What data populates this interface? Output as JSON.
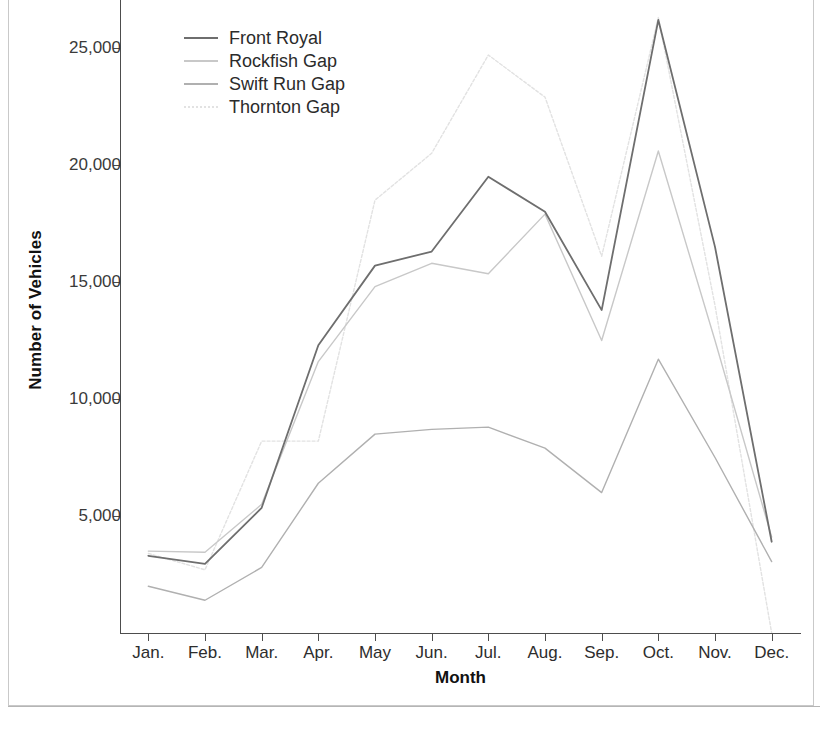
{
  "figure": {
    "y_axis_title": "Number of Vehicles",
    "x_axis_title": "Month",
    "bottom_text": ""
  },
  "legend": {
    "position": "top-left-inside",
    "items": [
      {
        "label": "Front Royal",
        "color": "#6e6e6e"
      },
      {
        "label": "Rockfish Gap",
        "color": "#c8c8c8"
      },
      {
        "label": "Swift Run Gap",
        "color": "#b0b0b0"
      },
      {
        "label": "Thornton Gap",
        "color": "#e2e2e2"
      }
    ]
  },
  "axes": {
    "y_ticks": [
      {
        "value": 5000,
        "label": "5,000"
      },
      {
        "value": 10000,
        "label": "10,000"
      },
      {
        "value": 15000,
        "label": "15,000"
      },
      {
        "value": 20000,
        "label": "20,000"
      },
      {
        "value": 25000,
        "label": "25,000"
      }
    ],
    "x_ticks": [
      "Jan.",
      "Feb.",
      "Mar.",
      "Apr.",
      "May",
      "Jun.",
      "Jul.",
      "Aug.",
      "Sep.",
      "Oct.",
      "Nov.",
      "Dec."
    ]
  },
  "chart_data": {
    "type": "line",
    "title": "",
    "xlabel": "Month",
    "ylabel": "Number of Vehicles",
    "ylim": [
      0,
      27000
    ],
    "grid": false,
    "legend_position": "upper left",
    "categories": [
      "Jan.",
      "Feb.",
      "Mar.",
      "Apr.",
      "May",
      "Jun.",
      "Jul.",
      "Aug.",
      "Sep.",
      "Oct.",
      "Nov.",
      "Dec."
    ],
    "series": [
      {
        "name": "Front Royal",
        "color": "#6e6e6e",
        "style": "solid",
        "values": [
          3300,
          2950,
          5350,
          12300,
          15700,
          16300,
          19500,
          18000,
          13800,
          26200,
          16500,
          3900
        ]
      },
      {
        "name": "Rockfish Gap",
        "color": "#c8c8c8",
        "style": "solid",
        "values": [
          3500,
          3450,
          5500,
          11600,
          14800,
          15800,
          15350,
          17900,
          12500,
          20600,
          12500,
          4100
        ]
      },
      {
        "name": "Swift Run Gap",
        "color": "#b0b0b0",
        "style": "solid",
        "values": [
          2000,
          1400,
          2800,
          6400,
          8500,
          8700,
          8800,
          7900,
          6000,
          11700,
          7500,
          3050
        ]
      },
      {
        "name": "Thornton Gap",
        "color": "#e2e2e2",
        "style": "dotted",
        "values": [
          3400,
          2700,
          8200,
          8200,
          18500,
          20500,
          24700,
          22900,
          16100,
          26300,
          14000,
          0
        ]
      }
    ]
  }
}
